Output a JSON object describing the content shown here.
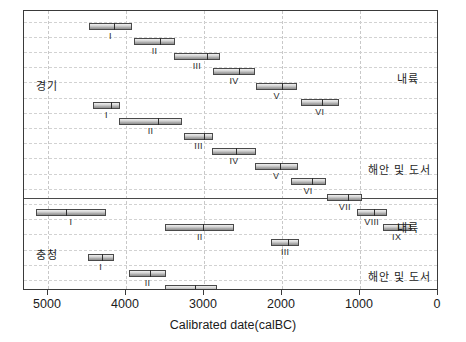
{
  "chart_data": {
    "type": "bar",
    "orientation": "horizontal-range",
    "title": "",
    "xlabel": "Calibrated date(calBC)",
    "ylabel": "",
    "xlim": [
      5600,
      0
    ],
    "x_reversed": true,
    "xticks": [
      5000,
      4000,
      3000,
      2000,
      1000,
      0
    ],
    "xticklabels": [
      "5000",
      "4000",
      "3000",
      "2000",
      "1000",
      "0"
    ],
    "grid": true,
    "legend": "none",
    "groups": [
      {
        "name": "경기",
        "subgroups": [
          {
            "name": "내륙",
            "bars": [
              {
                "label": "I",
                "start": 4480,
                "end": 3920,
                "mid": 4170
              },
              {
                "label": "II",
                "start": 3900,
                "end": 3370,
                "mid": 3580
              },
              {
                "label": "III",
                "start": 3380,
                "end": 2800,
                "mid": 2980
              },
              {
                "label": "IV",
                "start": 2880,
                "end": 2350,
                "mid": 2560
              },
              {
                "label": "V",
                "start": 2330,
                "end": 1810,
                "mid": 2010
              },
              {
                "label": "VI",
                "start": 1760,
                "end": 1270,
                "mid": 1500
              }
            ]
          },
          {
            "name": "해안 및 도서",
            "bars": [
              {
                "label": "I",
                "start": 4420,
                "end": 4080,
                "mid": 4210
              },
              {
                "label": "II",
                "start": 4090,
                "end": 3280,
                "mid": 3600
              },
              {
                "label": "III",
                "start": 3260,
                "end": 2880,
                "mid": 3010
              },
              {
                "label": "IV",
                "start": 2900,
                "end": 2330,
                "mid": 2600
              },
              {
                "label": "V",
                "start": 2350,
                "end": 1800,
                "mid": 2040
              },
              {
                "label": "VI",
                "start": 1890,
                "end": 1440,
                "mid": 1630
              },
              {
                "label": "VII",
                "start": 1420,
                "end": 970,
                "mid": 1170
              },
              {
                "label": "VIII",
                "start": 1040,
                "end": 660,
                "mid": 830
              },
              {
                "label": "IX",
                "start": 710,
                "end": 350,
                "mid": 520
              }
            ]
          }
        ]
      },
      {
        "name": "충청",
        "subgroups": [
          {
            "name": "내륙",
            "bars": [
              {
                "label": "I",
                "start": 5160,
                "end": 4250,
                "mid": 4780
              },
              {
                "label": "II",
                "start": 3500,
                "end": 2610,
                "mid": 3030
              },
              {
                "label": "III",
                "start": 2140,
                "end": 1780,
                "mid": 1940
              }
            ]
          },
          {
            "name": "해안 및 도서",
            "bars": [
              {
                "label": "I",
                "start": 4490,
                "end": 4160,
                "mid": 4320
              },
              {
                "label": "II",
                "start": 3960,
                "end": 3490,
                "mid": 3700
              },
              {
                "label": "III·IV",
                "start": 3500,
                "end": 2830,
                "mid": 3130
              },
              {
                "label": "V",
                "start": 2720,
                "end": 2180,
                "mid": 2420
              },
              {
                "label": "VI",
                "start": 2060,
                "end": 1720,
                "mid": 1880
              },
              {
                "label": "VII",
                "start": 1320,
                "end": 920,
                "mid": 1100
              }
            ]
          }
        ]
      }
    ]
  },
  "axis": {
    "x_title": "Calibrated date(calBC)",
    "ticks": [
      "5000",
      "4000",
      "3000",
      "2000",
      "1000",
      "0"
    ]
  },
  "labels": {
    "gyeonggi": "경기",
    "chungcheong": "충청",
    "inland_1": "내륙",
    "coastal_1": "해안 및 도서",
    "inland_2": "내륙",
    "coastal_2": "해안 및 도서"
  },
  "colors": {
    "bar_fill": "#c9c9c9",
    "bar_border": "#494949",
    "grid": "#c8c8c8",
    "frame": "#3a3a3a",
    "text": "#1b1b1b"
  }
}
